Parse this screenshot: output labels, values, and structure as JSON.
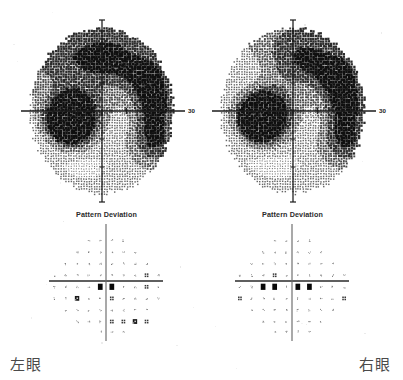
{
  "report": {
    "panels": [
      {
        "eye": "left",
        "eye_label": "左眼",
        "grayscale": {
          "axis_label": "30",
          "axis_label_side": "right",
          "defect_quadrant": "lower-left",
          "defect_label": "blind-spot-scotoma"
        },
        "pattern_deviation": {
          "title": "Pattern Deviation"
        }
      },
      {
        "eye": "right",
        "eye_label": "右眼",
        "grayscale": {
          "axis_label": "30",
          "axis_label_side": "right",
          "defect_quadrant": "lower-right",
          "defect_label": "blind-spot-scotoma"
        },
        "pattern_deviation": {
          "title": "Pattern Deviation"
        }
      }
    ]
  },
  "chart_data": [
    {
      "type": "heatmap",
      "name": "grayscale-left",
      "title": "",
      "eye": "左眼",
      "xlabel": "",
      "ylabel": "",
      "axis_tick_label": "30",
      "xlim": [
        -30,
        30
      ],
      "ylim": [
        -30,
        30
      ],
      "grid": false,
      "legend": "none",
      "description": "Humphrey grayscale total-sensitivity map, left eye. Dense stipple cloud filling a circular 30-degree field; dark dense scotoma blob centred near (-14,-4); moderately darker stipple bands along the superior-nasal arc and the inferior-temporal arc.",
      "cells": [
        {
          "x": -14,
          "y": -4,
          "level": 10
        },
        {
          "x": -12,
          "y": -4,
          "level": 9
        },
        {
          "x": -16,
          "y": -4,
          "level": 9
        },
        {
          "x": -14,
          "y": -7,
          "level": 8
        },
        {
          "x": -12,
          "y": -7,
          "level": 7
        },
        {
          "x": -16,
          "y": -1,
          "level": 6
        },
        {
          "x": -10,
          "y": -1,
          "level": 5
        },
        {
          "x": 20,
          "y": 14,
          "level": 5
        },
        {
          "x": 22,
          "y": 2,
          "level": 5
        },
        {
          "x": 22,
          "y": -12,
          "level": 5
        },
        {
          "x": -18,
          "y": 18,
          "level": 4
        },
        {
          "x": -4,
          "y": 22,
          "level": 4
        },
        {
          "x": 8,
          "y": 22,
          "level": 4
        },
        {
          "x": 0,
          "y": 0,
          "level": 2
        }
      ]
    },
    {
      "type": "heatmap",
      "name": "grayscale-right",
      "title": "",
      "eye": "右眼",
      "xlabel": "",
      "ylabel": "",
      "axis_tick_label": "30",
      "xlim": [
        -30,
        30
      ],
      "ylim": [
        -30,
        30
      ],
      "grid": false,
      "legend": "none",
      "description": "Humphrey grayscale total-sensitivity map, right eye. Dense stipple cloud filling a circular 30-degree field; dark dense scotoma blob centred near (+14,-3); moderately darker stipple band along the superior-nasal arc and the mid-temporal rim.",
      "cells": [
        {
          "x": 14,
          "y": -3,
          "level": 10
        },
        {
          "x": 12,
          "y": -3,
          "level": 9
        },
        {
          "x": 16,
          "y": -3,
          "level": 9
        },
        {
          "x": 14,
          "y": -6,
          "level": 8
        },
        {
          "x": 12,
          "y": -6,
          "level": 7
        },
        {
          "x": 16,
          "y": 0,
          "level": 6
        },
        {
          "x": 10,
          "y": 0,
          "level": 5
        },
        {
          "x": -20,
          "y": 14,
          "level": 5
        },
        {
          "x": -22,
          "y": 2,
          "level": 5
        },
        {
          "x": -22,
          "y": -12,
          "level": 5
        },
        {
          "x": -10,
          "y": 22,
          "level": 4
        },
        {
          "x": 4,
          "y": 22,
          "level": 4
        },
        {
          "x": 0,
          "y": 0,
          "level": 2
        }
      ]
    },
    {
      "type": "scatter",
      "name": "pattern-deviation-left",
      "title": "Pattern Deviation",
      "eye": "左眼",
      "xlabel": "",
      "ylabel": "",
      "xlim": [
        -27,
        27
      ],
      "ylim": [
        -27,
        27
      ],
      "grid": false,
      "legend": "none",
      "symbol_scale": [
        {
          "code": "dot",
          "meaning": "p >= 5% (normal)"
        },
        {
          "code": "half",
          "meaning": "p < 5%"
        },
        {
          "code": "quarter",
          "meaning": "p < 2%"
        },
        {
          "code": "dense",
          "meaning": "p < 1%"
        },
        {
          "code": "solid",
          "meaning": "p < 0.5%"
        }
      ],
      "points": [
        {
          "x": -9,
          "y": 21,
          "symbol": "dot"
        },
        {
          "x": -3,
          "y": 21,
          "symbol": "dot"
        },
        {
          "x": 3,
          "y": 21,
          "symbol": "dot"
        },
        {
          "x": 9,
          "y": 21,
          "symbol": "dot"
        },
        {
          "x": -15,
          "y": 15,
          "symbol": "dot"
        },
        {
          "x": -9,
          "y": 15,
          "symbol": "dot"
        },
        {
          "x": -3,
          "y": 15,
          "symbol": "dot"
        },
        {
          "x": 3,
          "y": 15,
          "symbol": "dot"
        },
        {
          "x": 9,
          "y": 15,
          "symbol": "dot"
        },
        {
          "x": 15,
          "y": 15,
          "symbol": "dot"
        },
        {
          "x": -21,
          "y": 9,
          "symbol": "dot"
        },
        {
          "x": -15,
          "y": 9,
          "symbol": "dot"
        },
        {
          "x": -9,
          "y": 9,
          "symbol": "dot"
        },
        {
          "x": -3,
          "y": 9,
          "symbol": "dot"
        },
        {
          "x": 3,
          "y": 9,
          "symbol": "dot"
        },
        {
          "x": 9,
          "y": 9,
          "symbol": "dot"
        },
        {
          "x": 15,
          "y": 9,
          "symbol": "dot"
        },
        {
          "x": 21,
          "y": 9,
          "symbol": "dot"
        },
        {
          "x": -27,
          "y": 3,
          "symbol": "dot"
        },
        {
          "x": -21,
          "y": 3,
          "symbol": "dot"
        },
        {
          "x": -15,
          "y": 3,
          "symbol": "dot"
        },
        {
          "x": -9,
          "y": 3,
          "symbol": "dot"
        },
        {
          "x": -3,
          "y": 3,
          "symbol": "dot"
        },
        {
          "x": 3,
          "y": 3,
          "symbol": "dot"
        },
        {
          "x": 9,
          "y": 3,
          "symbol": "dot"
        },
        {
          "x": 15,
          "y": 3,
          "symbol": "dot"
        },
        {
          "x": 21,
          "y": 3,
          "symbol": "quarter"
        },
        {
          "x": 27,
          "y": 3,
          "symbol": "dot"
        },
        {
          "x": -27,
          "y": -3,
          "symbol": "dot"
        },
        {
          "x": -21,
          "y": -3,
          "symbol": "dot"
        },
        {
          "x": -15,
          "y": -3,
          "symbol": "dot"
        },
        {
          "x": -9,
          "y": -3,
          "symbol": "dot"
        },
        {
          "x": -3,
          "y": -3,
          "symbol": "solid"
        },
        {
          "x": 3,
          "y": -3,
          "symbol": "solid"
        },
        {
          "x": 9,
          "y": -3,
          "symbol": "dot"
        },
        {
          "x": 15,
          "y": -3,
          "symbol": "dot"
        },
        {
          "x": 21,
          "y": -3,
          "symbol": "quarter"
        },
        {
          "x": 27,
          "y": -3,
          "symbol": "dot"
        },
        {
          "x": -27,
          "y": -9,
          "symbol": "dot"
        },
        {
          "x": -21,
          "y": -9,
          "symbol": "dot"
        },
        {
          "x": -15,
          "y": -9,
          "symbol": "dense"
        },
        {
          "x": -9,
          "y": -9,
          "symbol": "dot"
        },
        {
          "x": -3,
          "y": -9,
          "symbol": "dot"
        },
        {
          "x": 3,
          "y": -9,
          "symbol": "quarter"
        },
        {
          "x": 9,
          "y": -9,
          "symbol": "dot"
        },
        {
          "x": 15,
          "y": -9,
          "symbol": "dot"
        },
        {
          "x": 21,
          "y": -9,
          "symbol": "dot"
        },
        {
          "x": 27,
          "y": -9,
          "symbol": "dot"
        },
        {
          "x": -21,
          "y": -15,
          "symbol": "dot"
        },
        {
          "x": -15,
          "y": -15,
          "symbol": "dot"
        },
        {
          "x": -9,
          "y": -15,
          "symbol": "dot"
        },
        {
          "x": -3,
          "y": -15,
          "symbol": "dot"
        },
        {
          "x": 3,
          "y": -15,
          "symbol": "dot"
        },
        {
          "x": 9,
          "y": -15,
          "symbol": "dot"
        },
        {
          "x": 15,
          "y": -15,
          "symbol": "dot"
        },
        {
          "x": 21,
          "y": -15,
          "symbol": "dot"
        },
        {
          "x": -15,
          "y": -21,
          "symbol": "dot"
        },
        {
          "x": -9,
          "y": -21,
          "symbol": "dot"
        },
        {
          "x": -3,
          "y": -21,
          "symbol": "dot"
        },
        {
          "x": 3,
          "y": -21,
          "symbol": "quarter"
        },
        {
          "x": 9,
          "y": -21,
          "symbol": "quarter"
        },
        {
          "x": 15,
          "y": -21,
          "symbol": "dense"
        },
        {
          "x": 21,
          "y": -21,
          "symbol": "quarter"
        },
        {
          "x": -3,
          "y": -26,
          "symbol": "dot"
        },
        {
          "x": 3,
          "y": -26,
          "symbol": "dot"
        },
        {
          "x": 9,
          "y": -26,
          "symbol": "dot"
        }
      ]
    },
    {
      "type": "scatter",
      "name": "pattern-deviation-right",
      "title": "Pattern Deviation",
      "eye": "右眼",
      "xlabel": "",
      "ylabel": "",
      "xlim": [
        -27,
        27
      ],
      "ylim": [
        -27,
        27
      ],
      "grid": false,
      "legend": "none",
      "symbol_scale": [
        {
          "code": "dot",
          "meaning": "p >= 5% (normal)"
        },
        {
          "code": "half",
          "meaning": "p < 5%"
        },
        {
          "code": "quarter",
          "meaning": "p < 2%"
        },
        {
          "code": "dense",
          "meaning": "p < 1%"
        },
        {
          "code": "solid",
          "meaning": "p < 0.5%"
        }
      ],
      "points": [
        {
          "x": -9,
          "y": 21,
          "symbol": "dot"
        },
        {
          "x": -3,
          "y": 21,
          "symbol": "dot"
        },
        {
          "x": 3,
          "y": 21,
          "symbol": "dot"
        },
        {
          "x": 9,
          "y": 21,
          "symbol": "dot"
        },
        {
          "x": -15,
          "y": 15,
          "symbol": "dot"
        },
        {
          "x": -9,
          "y": 15,
          "symbol": "dot"
        },
        {
          "x": -3,
          "y": 15,
          "symbol": "dot"
        },
        {
          "x": 3,
          "y": 15,
          "symbol": "dot"
        },
        {
          "x": 9,
          "y": 15,
          "symbol": "dot"
        },
        {
          "x": 15,
          "y": 15,
          "symbol": "dot"
        },
        {
          "x": -21,
          "y": 9,
          "symbol": "dot"
        },
        {
          "x": -15,
          "y": 9,
          "symbol": "dot"
        },
        {
          "x": -9,
          "y": 9,
          "symbol": "dot"
        },
        {
          "x": -3,
          "y": 9,
          "symbol": "dot"
        },
        {
          "x": 3,
          "y": 9,
          "symbol": "dot"
        },
        {
          "x": 9,
          "y": 9,
          "symbol": "dot"
        },
        {
          "x": 15,
          "y": 9,
          "symbol": "dot"
        },
        {
          "x": 21,
          "y": 9,
          "symbol": "dot"
        },
        {
          "x": -27,
          "y": 3,
          "symbol": "dot"
        },
        {
          "x": -21,
          "y": 3,
          "symbol": "dot"
        },
        {
          "x": -15,
          "y": 3,
          "symbol": "dot"
        },
        {
          "x": -9,
          "y": 3,
          "symbol": "quarter"
        },
        {
          "x": -3,
          "y": 3,
          "symbol": "dot"
        },
        {
          "x": 3,
          "y": 3,
          "symbol": "dot"
        },
        {
          "x": 9,
          "y": 3,
          "symbol": "dot"
        },
        {
          "x": 15,
          "y": 3,
          "symbol": "dot"
        },
        {
          "x": 21,
          "y": 3,
          "symbol": "dot"
        },
        {
          "x": 27,
          "y": 3,
          "symbol": "dot"
        },
        {
          "x": -27,
          "y": -3,
          "symbol": "dot"
        },
        {
          "x": -21,
          "y": -3,
          "symbol": "dot"
        },
        {
          "x": -15,
          "y": -3,
          "symbol": "solid"
        },
        {
          "x": -9,
          "y": -3,
          "symbol": "solid"
        },
        {
          "x": -3,
          "y": -3,
          "symbol": "dot"
        },
        {
          "x": 3,
          "y": -3,
          "symbol": "solid"
        },
        {
          "x": 9,
          "y": -3,
          "symbol": "solid"
        },
        {
          "x": 15,
          "y": -3,
          "symbol": "dot"
        },
        {
          "x": 21,
          "y": -3,
          "symbol": "dot"
        },
        {
          "x": 27,
          "y": -3,
          "symbol": "dot"
        },
        {
          "x": -27,
          "y": -9,
          "symbol": "quarter"
        },
        {
          "x": -21,
          "y": -9,
          "symbol": "dot"
        },
        {
          "x": -15,
          "y": -9,
          "symbol": "dot"
        },
        {
          "x": -9,
          "y": -9,
          "symbol": "dot"
        },
        {
          "x": -3,
          "y": -9,
          "symbol": "dot"
        },
        {
          "x": 3,
          "y": -9,
          "symbol": "dot"
        },
        {
          "x": 9,
          "y": -9,
          "symbol": "dot"
        },
        {
          "x": 15,
          "y": -9,
          "symbol": "dot"
        },
        {
          "x": 21,
          "y": -9,
          "symbol": "dot"
        },
        {
          "x": 27,
          "y": -9,
          "symbol": "quarter"
        },
        {
          "x": -21,
          "y": -15,
          "symbol": "dot"
        },
        {
          "x": -15,
          "y": -15,
          "symbol": "dot"
        },
        {
          "x": -9,
          "y": -15,
          "symbol": "dot"
        },
        {
          "x": -3,
          "y": -15,
          "symbol": "dot"
        },
        {
          "x": 3,
          "y": -15,
          "symbol": "dot"
        },
        {
          "x": 9,
          "y": -15,
          "symbol": "dot"
        },
        {
          "x": 15,
          "y": -15,
          "symbol": "dot"
        },
        {
          "x": 21,
          "y": -15,
          "symbol": "dot"
        },
        {
          "x": -15,
          "y": -21,
          "symbol": "dot"
        },
        {
          "x": -9,
          "y": -21,
          "symbol": "dot"
        },
        {
          "x": -3,
          "y": -21,
          "symbol": "dot"
        },
        {
          "x": 3,
          "y": -21,
          "symbol": "dot"
        },
        {
          "x": 9,
          "y": -21,
          "symbol": "dot"
        },
        {
          "x": 15,
          "y": -21,
          "symbol": "dot"
        },
        {
          "x": -9,
          "y": -26,
          "symbol": "dot"
        },
        {
          "x": -3,
          "y": -26,
          "symbol": "dot"
        },
        {
          "x": 3,
          "y": -26,
          "symbol": "dot"
        },
        {
          "x": 9,
          "y": -26,
          "symbol": "dot"
        }
      ]
    }
  ]
}
